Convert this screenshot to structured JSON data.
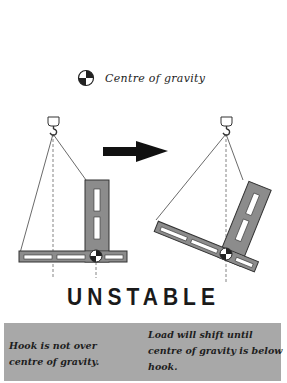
{
  "legend": {
    "icon": "centre-of-gravity-icon",
    "label": "Centre of gravity"
  },
  "diagram": {
    "before": {
      "state": "Hook not over centre of gravity"
    },
    "arrow": "arrow-right-icon",
    "after": {
      "state": "Load shifted, centre of gravity below hook"
    },
    "colors": {
      "load_fill": "#8c8c8c",
      "load_stroke": "#333333",
      "slot_fill": "#ffffff",
      "sling": "#444444",
      "plumb_line": "#666666",
      "arrow": "#111111"
    }
  },
  "title": "UNSTABLE",
  "notes": {
    "left": "Hook is not over centre of gravity.",
    "right": "Load will shift until centre of gravity is below hook."
  },
  "colors": {
    "info_box_bg": "#a8a8a8",
    "text": "#1e1e1e"
  }
}
